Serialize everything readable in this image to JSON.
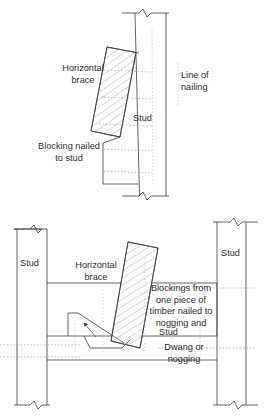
{
  "figure": {
    "background_color": "#ffffff",
    "line_color": "#3a3a3a",
    "hatch_color": "#6d6d6d",
    "dotted_color": "#9a9a9a",
    "text_color": "#2b2b2b"
  },
  "top_diagram": {
    "name": "brace-blocking-nailed-to-stud",
    "labels": {
      "horizontal_brace_line1": "Horizontal",
      "horizontal_brace_line2": "brace",
      "blocking_line1": "Blocking nailed",
      "blocking_line2": "to stud",
      "stud": "Stud",
      "line_of_nailing_line1": "Line of",
      "line_of_nailing_line2": "nailing"
    }
  },
  "bottom_diagram": {
    "name": "brace-blockings-nailed-to-nogging",
    "labels": {
      "stud_left": "Stud",
      "stud_right": "Stud",
      "horizontal_brace_line1": "Horizontal",
      "horizontal_brace_line2": "brace",
      "blockings_line1": "Blockings from",
      "blockings_line2": "one piece of",
      "blockings_line3": "timber nailed to",
      "blockings_line4": "nogging and",
      "stud_center": "Stud",
      "dwang_line1": "Dwang or",
      "dwang_line2": "nogging"
    }
  },
  "icons": {
    "break_symbol": "zigzag-break-icon",
    "leader_arrow": "leader-arrow-icon"
  }
}
